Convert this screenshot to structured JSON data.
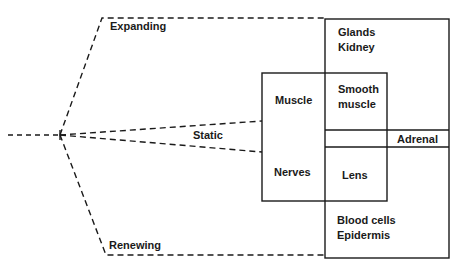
{
  "diagram": {
    "branches": {
      "expanding": "Expanding",
      "static": "Static",
      "renewing": "Renewing"
    },
    "boxes": {
      "expanding_box": {
        "line1": "Glands",
        "line2": "Kidney"
      },
      "static_box": {
        "upper": "Muscle",
        "lower": "Nerves"
      },
      "overlap_upper": {
        "line1": "Smooth",
        "line2": "muscle"
      },
      "overlap_lower": "Lens",
      "adrenal_strip": "Adrenal",
      "renewing_box": {
        "line1": "Blood cells",
        "line2": "Epidermis"
      }
    },
    "colors": {
      "line": "#1a1a1a",
      "background": "#ffffff"
    }
  }
}
